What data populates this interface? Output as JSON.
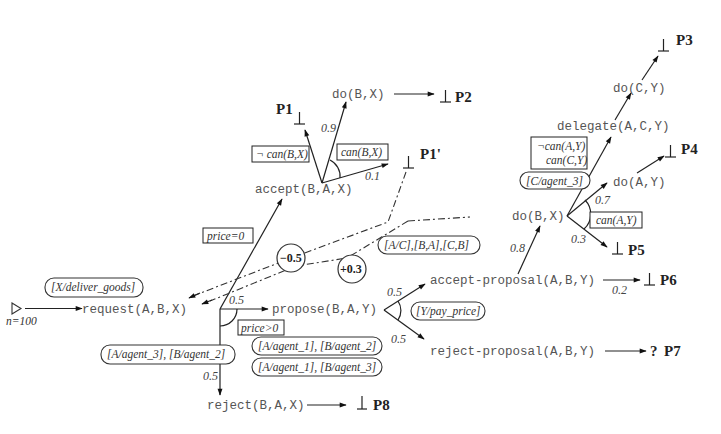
{
  "diagram": {
    "type": "protocol-tree",
    "start": {
      "label": "n=100",
      "icon": "start-triangle-icon"
    },
    "nodes": {
      "request": "request(A,B,X)",
      "propose": "propose(B,A,Y)",
      "accept": "accept(B,A,X)",
      "reject": "reject(B,A,X)",
      "do_bx_top": "do(B,X)",
      "accept_proposal": "accept-proposal(A,B,Y)",
      "reject_proposal": "reject-proposal(A,B,Y)",
      "do_bx_right": "do(B,X)",
      "delegate": "delegate(A,C,Y)",
      "do_cy": "do(C,Y)",
      "do_ay": "do(A,Y)"
    },
    "outcomes": {
      "p1": "P1",
      "p1prime": "P1'",
      "p2": "P2",
      "p3": "P3",
      "p4": "P4",
      "p5": "P5",
      "p6": "P6",
      "p7": "P7",
      "p7_marker": "?",
      "terminal_symbol": "⊥"
    },
    "conditions": {
      "not_can_bx": "¬ can(B,X)",
      "can_bx": "can(B,X)",
      "price_zero": "price=0",
      "price_gt_zero": "price>0",
      "not_can_ay": "¬can(A,Y)",
      "can_cy": "can(C,Y)",
      "can_ay": "can(A,Y)"
    },
    "bindings": {
      "deliver_goods": "[X/deliver_goods]",
      "agents_3_2": "[A/agent_3], [B/agent_2]",
      "agents_1_2": "[A/agent_1], [B/agent_2]",
      "agents_1_3": "[A/agent_1], [B/agent_3]",
      "pay_price": "[Y/pay_price]",
      "swap_roles": "[A/C],[B,A],[C,B]",
      "c_agent3": "[C/agent_3]"
    },
    "probabilities": {
      "req_propose": "0.5",
      "req_reject": "0.5",
      "acc_do": "0.9",
      "acc_p1prime": "0.1",
      "prop_accept": "0.5",
      "prop_reject": "0.5",
      "ap_do": "0.8",
      "ap_p6": "0.2",
      "do_ay": "0.7",
      "do_p5": "0.3"
    },
    "feedback": {
      "neg": "−0.5",
      "pos": "+0.3"
    }
  }
}
